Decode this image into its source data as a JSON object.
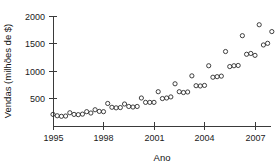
{
  "chart_data": {
    "type": "scatter",
    "title": "",
    "xlabel": "Ano",
    "ylabel": "Vendas (milhões de $)",
    "xlim": [
      1995,
      2008.25
    ],
    "ylim": [
      0,
      2100
    ],
    "grid": false,
    "legend": false,
    "xticks": [
      1995,
      1998,
      2001,
      2004,
      2007
    ],
    "xticklabels": [
      "1995",
      "1998",
      "2001",
      "2004",
      "2007"
    ],
    "yticks": [
      500,
      1000,
      1500,
      2000
    ],
    "yticklabels": [
      "500",
      "1000",
      "1500",
      "2000"
    ],
    "marker": "open-circle",
    "marker_color": "#2b2b2b",
    "series": [
      {
        "name": "Vendas trimestrais",
        "x": [
          1995.0,
          1995.25,
          1995.5,
          1995.75,
          1996.0,
          1996.25,
          1996.5,
          1996.75,
          1997.0,
          1997.25,
          1997.5,
          1997.75,
          1998.0,
          1998.25,
          1998.5,
          1998.75,
          1999.0,
          1999.25,
          1999.5,
          1999.75,
          2000.0,
          2000.25,
          2000.5,
          2000.75,
          2001.0,
          2001.25,
          2001.5,
          2001.75,
          2002.0,
          2002.25,
          2002.5,
          2002.75,
          2003.0,
          2003.25,
          2003.5,
          2003.75,
          2004.0,
          2004.25,
          2004.5,
          2004.75,
          2005.0,
          2005.25,
          2005.5,
          2005.75,
          2006.0,
          2006.25,
          2006.5,
          2006.75,
          2007.0,
          2007.25,
          2007.5,
          2007.75,
          2008.0
        ],
        "y": [
          200,
          175,
          165,
          170,
          230,
          200,
          195,
          205,
          250,
          225,
          285,
          255,
          250,
          400,
          330,
          320,
          325,
          390,
          345,
          335,
          345,
          500,
          420,
          420,
          420,
          615,
          490,
          500,
          520,
          760,
          615,
          600,
          610,
          905,
          725,
          720,
          730,
          1090,
          880,
          890,
          900,
          1350,
          1075,
          1090,
          1095,
          1640,
          1300,
          1315,
          1280,
          1840,
          1470,
          1500,
          1715
        ]
      }
    ]
  },
  "geometry": {
    "plot_left": 53,
    "plot_right": 271,
    "plot_top": 16,
    "plot_bottom": 126,
    "y_axis_x": 53,
    "x_axis_y": 126
  }
}
